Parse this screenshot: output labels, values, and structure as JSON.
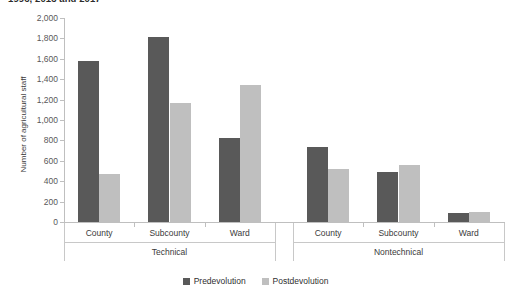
{
  "figure": {
    "clipped_title": "1996, 2013 and 2017",
    "legend_position": "bottom-center"
  },
  "chart_data": {
    "type": "bar",
    "title": "",
    "xlabel": "",
    "ylabel": "Number of agricultural staff",
    "ylim": [
      0,
      2000
    ],
    "ytick_labels": [
      "0",
      "200",
      "400",
      "600",
      "800",
      "1,000",
      "1,200",
      "1,400",
      "1,600",
      "1,800",
      "2,000"
    ],
    "ytick_values": [
      0,
      200,
      400,
      600,
      800,
      1000,
      1200,
      1400,
      1600,
      1800,
      2000
    ],
    "grid": false,
    "groups": [
      {
        "label": "Technical",
        "categories": [
          "County",
          "Subcounty",
          "Ward"
        ]
      },
      {
        "label": "Nontechnical",
        "categories": [
          "County",
          "Subcounty",
          "Ward"
        ]
      }
    ],
    "categories": [
      "County",
      "Subcounty",
      "Ward",
      "County",
      "Subcounty",
      "Ward"
    ],
    "series": [
      {
        "name": "Predevolution",
        "color": "#595959",
        "values": [
          1580,
          1810,
          820,
          740,
          495,
          90
        ]
      },
      {
        "name": "Postdevolution",
        "color": "#bfbfbf",
        "values": [
          470,
          1170,
          1340,
          520,
          555,
          100
        ]
      }
    ]
  }
}
